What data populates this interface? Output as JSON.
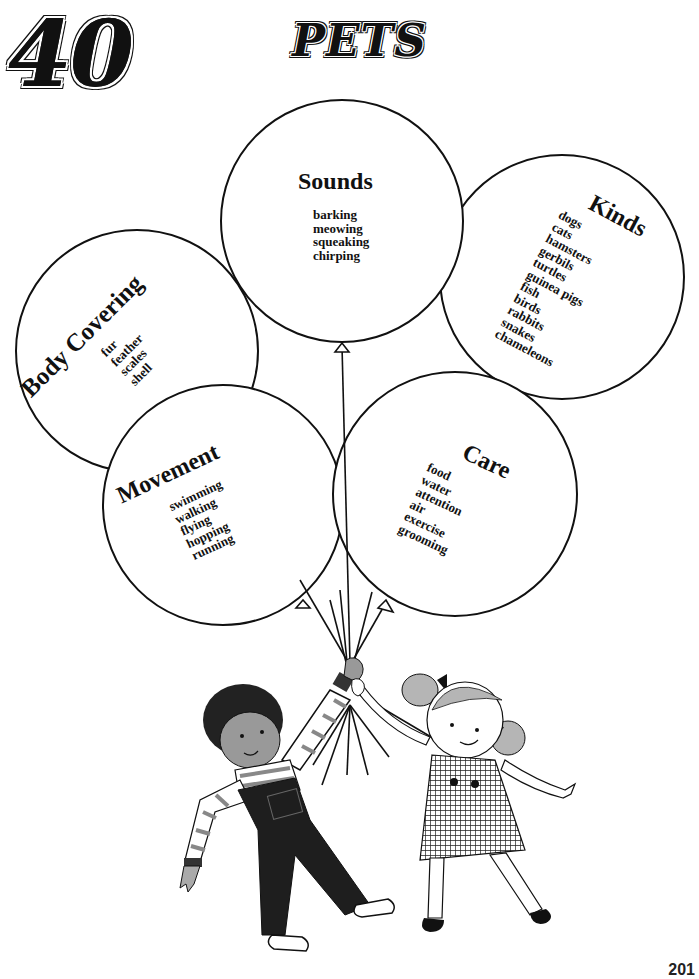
{
  "page": {
    "unit_number": "40",
    "title": "PETS",
    "page_number": "201"
  },
  "balloons": [
    {
      "id": "sounds",
      "heading": "Sounds",
      "items": [
        "barking",
        "meowing",
        "squeaking",
        "chirping"
      ]
    },
    {
      "id": "kinds",
      "heading": "Kinds",
      "items": [
        "dogs",
        "cats",
        "hamsters",
        "gerbils",
        "turtles",
        "guinea pigs",
        "fish",
        "birds",
        "rabbits",
        "snakes",
        "chameleons"
      ]
    },
    {
      "id": "body-covering",
      "heading": "Body Covering",
      "items": [
        "fur",
        "feather",
        "scales",
        "shell"
      ]
    },
    {
      "id": "movement",
      "heading": "Movement",
      "items": [
        "swimming",
        "walking",
        "flying",
        "hopping",
        "running"
      ]
    },
    {
      "id": "care",
      "heading": "Care",
      "items": [
        "food",
        "water",
        "attention",
        "air",
        "exercise",
        "grooming"
      ]
    }
  ],
  "illustration": {
    "description": "boy and girl holding balloon strings"
  },
  "colors": {
    "ink": "#111111",
    "paper": "#ffffff",
    "skin_shade": "#9a9a9a",
    "hair_light": "#b5b5b5"
  }
}
